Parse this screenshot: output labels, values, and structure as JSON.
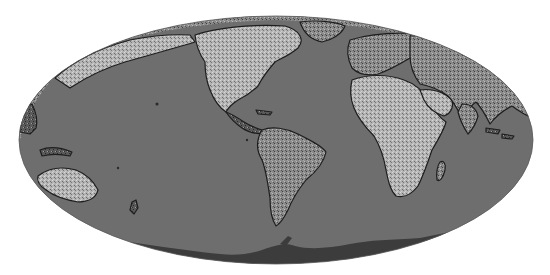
{
  "map": {
    "projection": "mollweide",
    "style": "grayscale",
    "colors": {
      "background": "#ffffff",
      "ocean": "#6e6e6e",
      "land_light": "#bdbdbd",
      "land_mid": "#8e8e8e",
      "land_dark": "#3a3a3a",
      "coastline": "#1e1e1e",
      "antarctica": "#3c3c3c"
    },
    "regions": [
      "north-america",
      "central-america",
      "south-america",
      "greenland",
      "europe",
      "africa",
      "madagascar",
      "asia",
      "arabia",
      "india",
      "australia",
      "new-zealand",
      "indonesia",
      "antarctica",
      "alaska"
    ]
  }
}
